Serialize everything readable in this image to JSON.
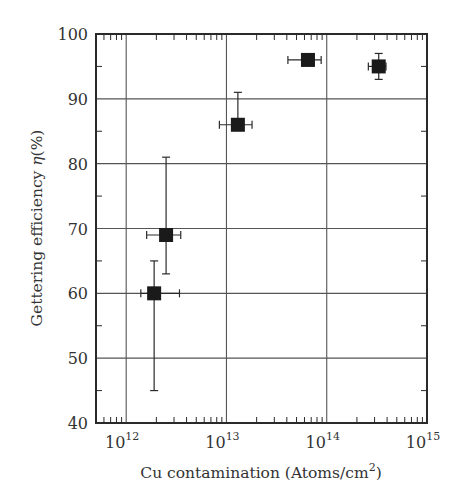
{
  "chart_data": {
    "type": "scatter",
    "title": "",
    "xlabel": "Cu contamination (Atoms/cm²)",
    "xlabel_parts": {
      "text": "Cu contamination (Atoms/cm",
      "sup": "2",
      "close": ")"
    },
    "ylabel": "Gettering efficiency η(%)",
    "ylabel_parts": {
      "text": "Gettering efficiency ",
      "italic": "η",
      "rest": "(%)"
    },
    "xscale": "log",
    "xlim": [
      500000000000.0,
      1000000000000000.0
    ],
    "ylim": [
      40,
      100
    ],
    "x_ticks": [
      {
        "value": 1000000000000.0,
        "base": "10",
        "exp": "12"
      },
      {
        "value": 10000000000000.0,
        "base": "10",
        "exp": "13"
      },
      {
        "value": 100000000000000.0,
        "base": "10",
        "exp": "14"
      },
      {
        "value": 1000000000000000.0,
        "base": "10",
        "exp": "15"
      }
    ],
    "y_ticks": [
      40,
      50,
      60,
      70,
      80,
      90,
      100
    ],
    "grid": true,
    "legend": null,
    "marker": "filled-square",
    "series": [
      {
        "name": "Gettering efficiency",
        "points": [
          {
            "x": 1900000000000.0,
            "y": 60,
            "y_err": [
              45,
              65
            ],
            "x_err": [
              1400000000000.0,
              3400000000000.0
            ]
          },
          {
            "x": 2500000000000.0,
            "y": 69,
            "y_err": [
              63,
              81
            ],
            "x_err": [
              1600000000000.0,
              3500000000000.0
            ]
          },
          {
            "x": 13000000000000.0,
            "y": 86,
            "y_err": [
              86,
              91
            ],
            "x_err": [
              8500000000000.0,
              18000000000000.0
            ]
          },
          {
            "x": 65000000000000.0,
            "y": 96,
            "y_err": [
              96,
              96
            ],
            "x_err": [
              41000000000000.0,
              88000000000000.0
            ]
          },
          {
            "x": 330000000000000.0,
            "y": 95,
            "y_err": [
              93,
              97
            ],
            "x_err": [
              260000000000000.0,
              390000000000000.0
            ]
          }
        ]
      }
    ]
  },
  "colors": {
    "frame": "#2a2a2a",
    "grid": "#555555",
    "marker": "#1a1a1a",
    "background": "#ffffff"
  }
}
